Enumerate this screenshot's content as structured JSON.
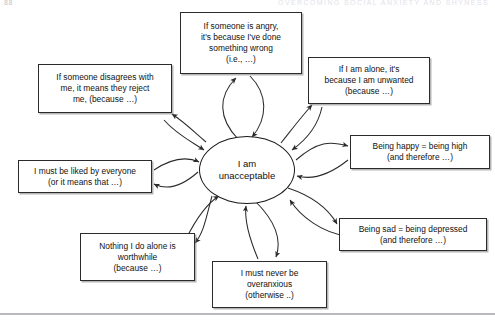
{
  "page": {
    "folio": "88",
    "running_head": "OVERCOMING SOCIAL ANXIETY AND SHYNESS"
  },
  "diagram": {
    "type": "radial-belief-map",
    "centre": {
      "name": "core-belief",
      "line1": "I am",
      "line2": "unacceptable"
    },
    "nodes": [
      {
        "id": "angry",
        "position": "top",
        "lines": [
          "If someone is angry,",
          "it's because I've done",
          "something wrong",
          "(i.e., …)"
        ]
      },
      {
        "id": "alone",
        "position": "top-right",
        "lines": [
          "If I am alone, it's",
          "because I am unwanted",
          "(because …)"
        ]
      },
      {
        "id": "happy",
        "position": "right",
        "lines": [
          "Being happy = being high",
          "(and therefore …)"
        ]
      },
      {
        "id": "sad",
        "position": "bottom-right",
        "lines": [
          "Being sad = being depressed",
          "(and therefore …)"
        ]
      },
      {
        "id": "overanxious",
        "position": "bottom",
        "lines": [
          "I must never be",
          "overanxious",
          "(otherwise ..)"
        ]
      },
      {
        "id": "nothing-alone",
        "position": "bottom-left",
        "lines": [
          "Nothing I do alone is",
          "worthwhile",
          "(because …)"
        ]
      },
      {
        "id": "liked",
        "position": "left",
        "lines": [
          "I must be liked by everyone",
          "(or it means that …)"
        ]
      },
      {
        "id": "disagrees",
        "position": "top-left",
        "lines": [
          "If someone disagrees with",
          "me, it means they reject",
          "me, (because …)"
        ]
      }
    ],
    "colors": {
      "stroke": "#2b2b2b",
      "centre_stroke": "#1a1a1a",
      "text": "#111111",
      "shadow": "#787a7d",
      "rule": "#b9b9bd",
      "background": "#ffffff"
    }
  }
}
